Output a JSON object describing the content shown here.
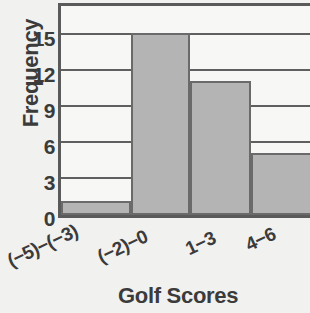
{
  "chart_data": {
    "type": "bar",
    "title": "",
    "subtitle": "",
    "xlabel": "Golf Scores",
    "ylabel": "Frequency",
    "categories": [
      "(−5)−(−3)",
      "(−2)−0",
      "1−3",
      "4−6"
    ],
    "values": [
      1,
      15,
      11,
      5
    ],
    "series": [
      {
        "name": "Frequency",
        "values": [
          1,
          15,
          11,
          5
        ]
      }
    ],
    "yticks": [
      0,
      3,
      6,
      9,
      12,
      15
    ],
    "ytick_labels": [
      "0",
      "3",
      "6",
      "9",
      "12",
      "15"
    ],
    "ylim": [
      0,
      18
    ],
    "grid": "horizontal",
    "legend": "none",
    "bar_fill_color": "#b4b4b4",
    "bar_edge_color": "#6a6a6a",
    "axis_color": "#5a5a5a",
    "text_color": "#3b3b3b",
    "background_color": "#f1f1ef",
    "xtick_rotation_deg": -25
  }
}
